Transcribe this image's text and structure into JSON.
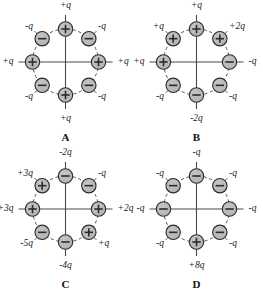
{
  "figure": {
    "panel_count": 4,
    "charges_per_panel": 8,
    "colors": {
      "background": "#ffffff",
      "charge_fill": "#b3b3b3",
      "charge_fill_light": "#c4c4c4",
      "charge_stroke": "#2b2b2b",
      "axis_line": "#4a4a4a",
      "dashed_circle": "#555555",
      "text": "#1a1a1a"
    }
  },
  "chart_data": {
    "type": "diagram",
    "positions": [
      "N",
      "NE",
      "E",
      "SE",
      "S",
      "SW",
      "W",
      "NW"
    ],
    "panels": [
      {
        "id": "A",
        "caption": "A",
        "net_charge": "0",
        "charges": [
          {
            "position": "N",
            "sign": "+",
            "label": "+q",
            "magnitude": 1
          },
          {
            "position": "NE",
            "sign": "-",
            "label": "-q",
            "magnitude": 1
          },
          {
            "position": "E",
            "sign": "+",
            "label": "+q",
            "magnitude": 1
          },
          {
            "position": "SE",
            "sign": "-",
            "label": "-q",
            "magnitude": 1
          },
          {
            "position": "S",
            "sign": "+",
            "label": "+q",
            "magnitude": 1
          },
          {
            "position": "SW",
            "sign": "-",
            "label": "-q",
            "magnitude": 1
          },
          {
            "position": "W",
            "sign": "+",
            "label": "+q",
            "magnitude": 1
          },
          {
            "position": "NW",
            "sign": "-",
            "label": "-q",
            "magnitude": 1
          }
        ]
      },
      {
        "id": "B",
        "caption": "B",
        "net_charge": "0",
        "charges": [
          {
            "position": "N",
            "sign": "+",
            "label": "+q",
            "magnitude": 1
          },
          {
            "position": "NE",
            "sign": "+",
            "label": "+2q",
            "magnitude": 2
          },
          {
            "position": "E",
            "sign": "-",
            "label": "-q",
            "magnitude": 1
          },
          {
            "position": "SE",
            "sign": "-",
            "label": "-q",
            "magnitude": 1
          },
          {
            "position": "S",
            "sign": "-",
            "label": "-2q",
            "magnitude": 2
          },
          {
            "position": "SW",
            "sign": "-",
            "label": "-q",
            "magnitude": 1
          },
          {
            "position": "W",
            "sign": "+",
            "label": "+q",
            "magnitude": 1
          },
          {
            "position": "NW",
            "sign": "+",
            "label": "+q",
            "magnitude": 1
          }
        ]
      },
      {
        "id": "C",
        "caption": "C",
        "net_charge": "0",
        "charges": [
          {
            "position": "N",
            "sign": "-",
            "label": "-2q",
            "magnitude": 2
          },
          {
            "position": "NE",
            "sign": "-",
            "label": "-q",
            "magnitude": 1
          },
          {
            "position": "E",
            "sign": "+",
            "label": "+2q",
            "magnitude": 2
          },
          {
            "position": "SE",
            "sign": "+",
            "label": "+q",
            "magnitude": 1
          },
          {
            "position": "S",
            "sign": "-",
            "label": "-4q",
            "magnitude": 4
          },
          {
            "position": "SW",
            "sign": "-",
            "label": "-5q",
            "magnitude": 5
          },
          {
            "position": "W",
            "sign": "+",
            "label": "+3q",
            "magnitude": 3
          },
          {
            "position": "NW",
            "sign": "+",
            "label": "+3q",
            "magnitude": 3
          }
        ]
      },
      {
        "id": "D",
        "caption": "D",
        "net_charge": "+q",
        "charges": [
          {
            "position": "N",
            "sign": "-",
            "label": "-q",
            "magnitude": 1
          },
          {
            "position": "NE",
            "sign": "-",
            "label": "-q",
            "magnitude": 1
          },
          {
            "position": "E",
            "sign": "-",
            "label": "-q",
            "magnitude": 1
          },
          {
            "position": "SE",
            "sign": "-",
            "label": "-q",
            "magnitude": 1
          },
          {
            "position": "S",
            "sign": "+",
            "label": "+8q",
            "magnitude": 8
          },
          {
            "position": "SW",
            "sign": "-",
            "label": "-q",
            "magnitude": 1
          },
          {
            "position": "W",
            "sign": "-",
            "label": "-q",
            "magnitude": 1
          },
          {
            "position": "NW",
            "sign": "-",
            "label": "-q",
            "magnitude": 1
          }
        ]
      }
    ]
  }
}
